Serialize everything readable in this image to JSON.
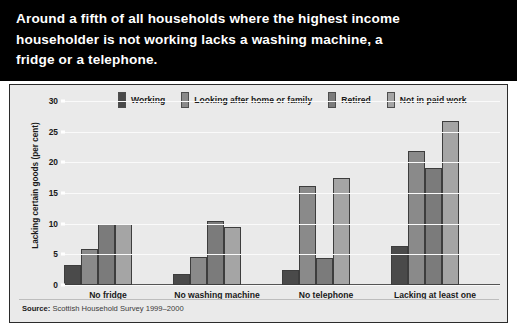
{
  "header": {
    "line1": "Around a fifth of all households where the highest income",
    "line2": "householder is not working lacks a washing machine, a",
    "line3": "fridge or a telephone."
  },
  "source": {
    "label": "Source:",
    "text": " Scottish Household Survey 1999–2000"
  },
  "colors": {
    "banner_bg": "#000000",
    "banner_text": "#ffffff",
    "panel_bg": "#eaeaea",
    "panel_border": "#2b2b2b",
    "gridline": "#fafafa",
    "series_working": "#4a4a4a",
    "series_looking": "#8a8a8a",
    "series_retired": "#7b7b7b",
    "series_notpaid": "#a5a5a5"
  },
  "chart_data": {
    "type": "bar",
    "title": "",
    "xlabel": "",
    "ylabel": "Lacking certain goods (per cent)",
    "ylim": [
      0,
      30
    ],
    "yticks": [
      0,
      5,
      10,
      15,
      20,
      25,
      30
    ],
    "ytick_labels": [
      "0",
      "5",
      "10",
      "15",
      "20",
      "25",
      "30"
    ],
    "grid": true,
    "legend_position": "top",
    "categories": [
      "No fridge",
      "No washing machine",
      "No telephone",
      "Lacking at least one"
    ],
    "series": [
      {
        "name": "Working",
        "color": "#4a4a4a",
        "values": [
          3.2,
          1.8,
          2.4,
          6.3
        ]
      },
      {
        "name": "Looking after home or family",
        "color": "#8a8a8a",
        "values": [
          5.9,
          4.5,
          16.2,
          21.9
        ]
      },
      {
        "name": "Retired",
        "color": "#7b7b7b",
        "values": [
          10.0,
          10.4,
          4.4,
          19.0
        ]
      },
      {
        "name": "Not in paid work",
        "color": "#a5a5a5",
        "values": [
          10.0,
          9.5,
          17.5,
          26.7
        ]
      }
    ]
  }
}
